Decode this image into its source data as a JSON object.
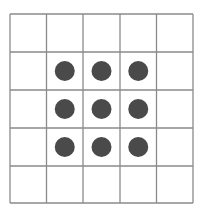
{
  "grid": {
    "rows": 5,
    "cols": 5,
    "x_lines": [
      10,
      46.5,
      83,
      120,
      156.5,
      193
    ],
    "y_lines": [
      14,
      52,
      90,
      128,
      166,
      203
    ],
    "line_color": "#8a8a8a",
    "line_width": 1.3
  },
  "dots": {
    "color": "#4a4a4a",
    "radius": 10,
    "cells": [
      {
        "row": 1,
        "col": 1
      },
      {
        "row": 1,
        "col": 2
      },
      {
        "row": 1,
        "col": 3
      },
      {
        "row": 2,
        "col": 1
      },
      {
        "row": 2,
        "col": 2
      },
      {
        "row": 2,
        "col": 3
      },
      {
        "row": 3,
        "col": 1
      },
      {
        "row": 3,
        "col": 2
      },
      {
        "row": 3,
        "col": 3
      }
    ]
  }
}
